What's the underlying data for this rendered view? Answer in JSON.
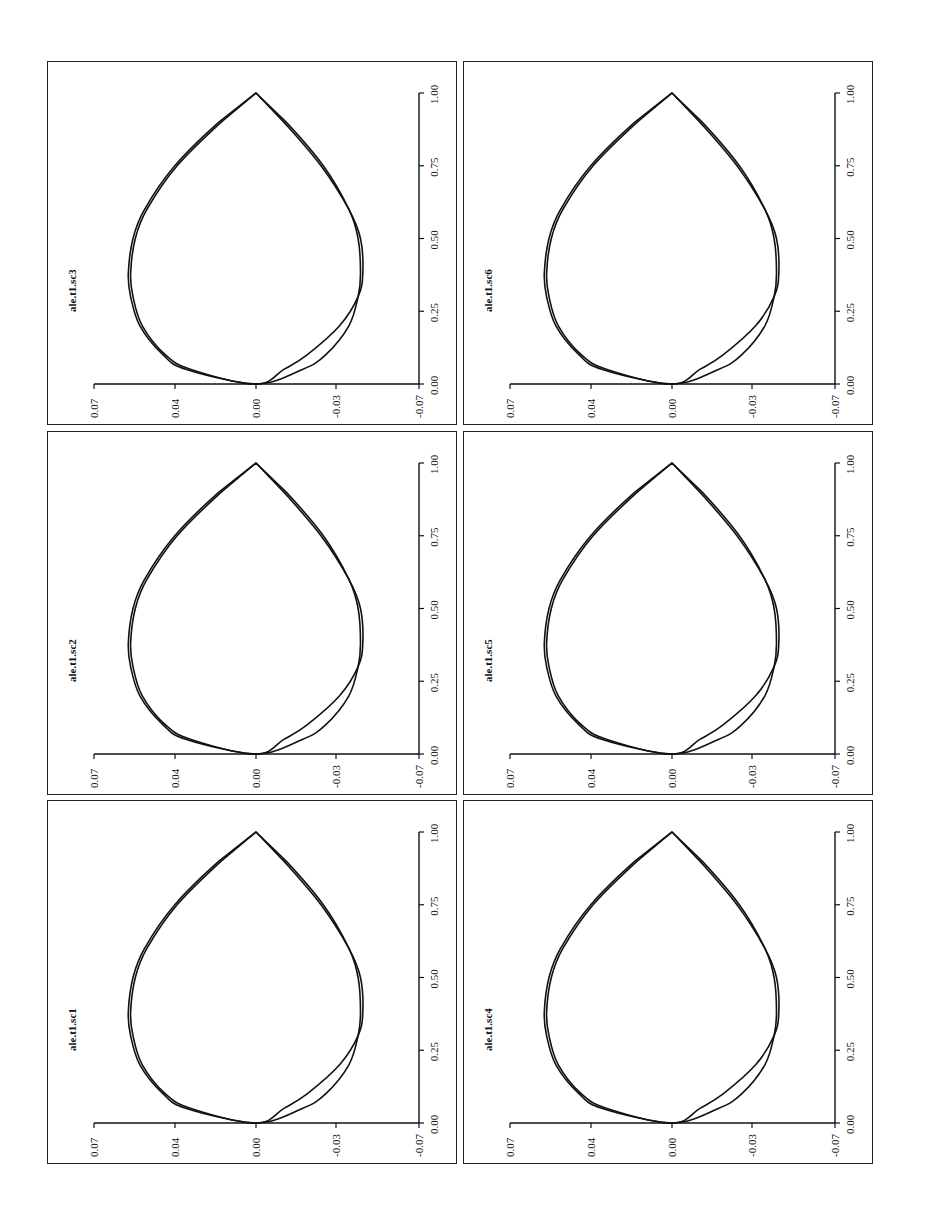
{
  "figure": {
    "layout": "3 rows x 2 columns of panels, page rotated 90 degrees counterclockwise",
    "panels": [
      {
        "id": "sc3",
        "label": "ale.t1.sc3",
        "row": 0,
        "col": 0
      },
      {
        "id": "sc6",
        "label": "ale.t1.sc6",
        "row": 0,
        "col": 1
      },
      {
        "id": "sc2",
        "label": "ale.t1.sc2",
        "row": 1,
        "col": 0
      },
      {
        "id": "sc5",
        "label": "ale.t1.sc5",
        "row": 1,
        "col": 1
      },
      {
        "id": "sc1",
        "label": "ale.t1.sc1",
        "row": 2,
        "col": 0
      },
      {
        "id": "sc4",
        "label": "ale.t1.sc4",
        "row": 2,
        "col": 1
      }
    ],
    "chord_ticks": [
      "0.00",
      "0.25",
      "0.50",
      "0.75",
      "1.00"
    ],
    "thickness_ticks": [
      "0.07",
      "0.04",
      "0.00",
      "-0.03",
      "-0.07"
    ]
  },
  "chart_data": {
    "type": "line",
    "title": "",
    "xlabel": "chord (x/c)",
    "ylabel": "thickness (y/c)",
    "xlim": [
      0.0,
      1.0
    ],
    "ylim": [
      -0.07,
      0.07
    ],
    "x_ticks": [
      0.0,
      0.25,
      0.5,
      0.75,
      1.0
    ],
    "y_ticks": [
      0.07,
      0.04,
      0.0,
      -0.03,
      -0.07
    ],
    "grid": false,
    "legend": null,
    "panels": [
      {
        "label": "ale.t1.sc1"
      },
      {
        "label": "ale.t1.sc2"
      },
      {
        "label": "ale.t1.sc3"
      },
      {
        "label": "ale.t1.sc4"
      },
      {
        "label": "ale.t1.sc5"
      },
      {
        "label": "ale.t1.sc6"
      }
    ],
    "series": [
      {
        "name": "curve A (outer)",
        "x": [
          0.0,
          0.05,
          0.1,
          0.2,
          0.3,
          0.38,
          0.5,
          0.6,
          0.75,
          0.9,
          1.0
        ],
        "upper": [
          0.0,
          0.03,
          0.04,
          0.05,
          0.054,
          0.055,
          0.053,
          0.048,
          0.035,
          0.016,
          0.0
        ],
        "lower": [
          0.0,
          -0.012,
          -0.022,
          -0.036,
          -0.044,
          -0.046,
          -0.045,
          -0.04,
          -0.028,
          -0.012,
          0.0
        ]
      },
      {
        "name": "curve B (inner)",
        "x": [
          0.0,
          0.05,
          0.1,
          0.2,
          0.3,
          0.38,
          0.5,
          0.6,
          0.75,
          0.9,
          1.0
        ],
        "upper": [
          0.0,
          0.028,
          0.039,
          0.049,
          0.053,
          0.054,
          0.052,
          0.047,
          0.034,
          0.015,
          0.0
        ],
        "lower": [
          0.0,
          -0.02,
          -0.03,
          -0.04,
          -0.044,
          -0.045,
          -0.044,
          -0.04,
          -0.029,
          -0.013,
          0.0
        ]
      }
    ]
  }
}
